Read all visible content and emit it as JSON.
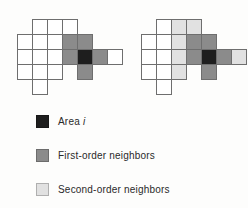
{
  "colors": {
    "area_i": "#1e1e1e",
    "first_order": "#8b8b8b",
    "second_order": "#e1e1e1",
    "empty": "#ffffff",
    "grid_line": "#6e6e6e"
  },
  "grids": [
    {
      "name": "first-order-grid",
      "origin_x": 17,
      "origin_y": 19,
      "cell_size": 15,
      "cells": [
        {
          "col": 2,
          "row": 1,
          "state": "empty"
        },
        {
          "col": 3,
          "row": 1,
          "state": "empty"
        },
        {
          "col": 4,
          "row": 1,
          "state": "empty"
        },
        {
          "col": 1,
          "row": 2,
          "state": "empty"
        },
        {
          "col": 2,
          "row": 2,
          "state": "empty"
        },
        {
          "col": 3,
          "row": 2,
          "state": "empty"
        },
        {
          "col": 4,
          "row": 2,
          "state": "first_order"
        },
        {
          "col": 5,
          "row": 2,
          "state": "first_order"
        },
        {
          "col": 1,
          "row": 3,
          "state": "empty"
        },
        {
          "col": 2,
          "row": 3,
          "state": "empty"
        },
        {
          "col": 3,
          "row": 3,
          "state": "empty"
        },
        {
          "col": 4,
          "row": 3,
          "state": "first_order"
        },
        {
          "col": 5,
          "row": 3,
          "state": "area_i"
        },
        {
          "col": 6,
          "row": 3,
          "state": "first_order"
        },
        {
          "col": 7,
          "row": 3,
          "state": "empty"
        },
        {
          "col": 1,
          "row": 4,
          "state": "empty"
        },
        {
          "col": 2,
          "row": 4,
          "state": "empty"
        },
        {
          "col": 3,
          "row": 4,
          "state": "empty"
        },
        {
          "col": 5,
          "row": 4,
          "state": "first_order"
        },
        {
          "col": 2,
          "row": 5,
          "state": "empty"
        }
      ]
    },
    {
      "name": "second-order-grid",
      "origin_x": 141,
      "origin_y": 19,
      "cell_size": 15,
      "cells": [
        {
          "col": 2,
          "row": 1,
          "state": "empty"
        },
        {
          "col": 3,
          "row": 1,
          "state": "second_order"
        },
        {
          "col": 4,
          "row": 1,
          "state": "second_order"
        },
        {
          "col": 1,
          "row": 2,
          "state": "empty"
        },
        {
          "col": 2,
          "row": 2,
          "state": "empty"
        },
        {
          "col": 3,
          "row": 2,
          "state": "second_order"
        },
        {
          "col": 4,
          "row": 2,
          "state": "first_order"
        },
        {
          "col": 5,
          "row": 2,
          "state": "first_order"
        },
        {
          "col": 1,
          "row": 3,
          "state": "empty"
        },
        {
          "col": 2,
          "row": 3,
          "state": "empty"
        },
        {
          "col": 3,
          "row": 3,
          "state": "second_order"
        },
        {
          "col": 4,
          "row": 3,
          "state": "first_order"
        },
        {
          "col": 5,
          "row": 3,
          "state": "area_i"
        },
        {
          "col": 6,
          "row": 3,
          "state": "first_order"
        },
        {
          "col": 7,
          "row": 3,
          "state": "second_order"
        },
        {
          "col": 1,
          "row": 4,
          "state": "empty"
        },
        {
          "col": 2,
          "row": 4,
          "state": "empty"
        },
        {
          "col": 3,
          "row": 4,
          "state": "second_order"
        },
        {
          "col": 5,
          "row": 4,
          "state": "first_order"
        },
        {
          "col": 2,
          "row": 5,
          "state": "empty"
        }
      ]
    }
  ],
  "legend": {
    "items": [
      {
        "state": "area_i",
        "label": "Area ",
        "label_italic": "i"
      },
      {
        "state": "first_order",
        "label": "First-order neighbors",
        "label_italic": ""
      },
      {
        "state": "second_order",
        "label": "Second-order neighbors",
        "label_italic": ""
      }
    ]
  }
}
